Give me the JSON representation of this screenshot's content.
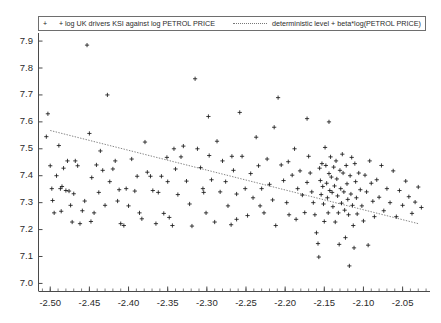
{
  "chart_data": {
    "type": "scatter",
    "title": "",
    "subtitle": "",
    "xlabel": "",
    "ylabel": "",
    "xlim": [
      -2.515,
      -2.015
    ],
    "ylim": [
      6.97,
      7.93
    ],
    "grid": false,
    "legend_position": "top-left",
    "legend": [
      {
        "name": "log UK drivers KSI against log PETROL PRICE",
        "marker": "plus",
        "style": "markers",
        "symbol": "+  +"
      },
      {
        "name": "deterministic level + beta*log(PETROL PRICE)",
        "marker": "none",
        "style": "dotted-line",
        "symbol": "......."
      }
    ],
    "xticks": [
      "-2.50",
      "-2.45",
      "-2.40",
      "-2.35",
      "-2.30",
      "-2.25",
      "-2.20",
      "-2.15",
      "-2.10",
      "-2.05"
    ],
    "xtick_values": [
      -2.5,
      -2.45,
      -2.4,
      -2.35,
      -2.3,
      -2.25,
      -2.2,
      -2.15,
      -2.1,
      -2.05
    ],
    "yticks": [
      "7.9",
      "7.8",
      "7.7",
      "7.6",
      "7.5",
      "7.4",
      "7.3",
      "7.2",
      "7.1",
      "7.0"
    ],
    "ytick_values": [
      7.9,
      7.8,
      7.7,
      7.6,
      7.5,
      7.4,
      7.3,
      7.2,
      7.1,
      7.0
    ],
    "series": [
      {
        "name": "log UK drivers KSI against log PETROL PRICE",
        "type": "scatter",
        "marker": "plus",
        "color": "#1a1a1a",
        "points": [
          [
            -2.503,
            7.63
          ],
          [
            -2.505,
            7.545
          ],
          [
            -2.5,
            7.437
          ],
          [
            -2.498,
            7.352
          ],
          [
            -2.497,
            7.308
          ],
          [
            -2.495,
            7.262
          ],
          [
            -2.492,
            7.4
          ],
          [
            -2.489,
            7.512
          ],
          [
            -2.487,
            7.352
          ],
          [
            -2.485,
            7.36
          ],
          [
            -2.483,
            7.428
          ],
          [
            -2.48,
            7.345
          ],
          [
            -2.478,
            7.455
          ],
          [
            -2.476,
            7.343
          ],
          [
            -2.474,
            7.29
          ],
          [
            -2.47,
            7.333
          ],
          [
            -2.468,
            7.455
          ],
          [
            -2.465,
            7.437
          ],
          [
            -2.462,
            7.222
          ],
          [
            -2.459,
            7.27
          ],
          [
            -2.456,
            7.306
          ],
          [
            -2.453,
            7.885
          ],
          [
            -2.45,
            7.557
          ],
          [
            -2.447,
            7.393
          ],
          [
            -2.444,
            7.262
          ],
          [
            -2.441,
            7.44
          ],
          [
            -2.438,
            7.338
          ],
          [
            -2.436,
            7.492
          ],
          [
            -2.433,
            7.42
          ],
          [
            -2.43,
            7.29
          ],
          [
            -2.427,
            7.7
          ],
          [
            -2.424,
            7.378
          ],
          [
            -2.42,
            7.425
          ],
          [
            -2.417,
            7.455
          ],
          [
            -2.414,
            7.306
          ],
          [
            -2.41,
            7.222
          ],
          [
            -2.406,
            7.215
          ],
          [
            -2.403,
            7.352
          ],
          [
            -2.4,
            7.288
          ],
          [
            -2.396,
            7.462
          ],
          [
            -2.392,
            7.343
          ],
          [
            -2.389,
            7.398
          ],
          [
            -2.386,
            7.262
          ],
          [
            -2.383,
            7.24
          ],
          [
            -2.379,
            7.525
          ],
          [
            -2.376,
            7.413
          ],
          [
            -2.372,
            7.398
          ],
          [
            -2.369,
            7.345
          ],
          [
            -2.365,
            7.222
          ],
          [
            -2.362,
            7.338
          ],
          [
            -2.358,
            7.398
          ],
          [
            -2.355,
            7.26
          ],
          [
            -2.351,
            7.468
          ],
          [
            -2.348,
            7.245
          ],
          [
            -2.344,
            7.215
          ],
          [
            -2.34,
            7.425
          ],
          [
            -2.337,
            7.33
          ],
          [
            -2.333,
            7.47
          ],
          [
            -2.33,
            7.51
          ],
          [
            -2.326,
            7.38
          ],
          [
            -2.322,
            7.295
          ],
          [
            -2.319,
            7.213
          ],
          [
            -2.315,
            7.76
          ],
          [
            -2.312,
            7.5
          ],
          [
            -2.308,
            7.43
          ],
          [
            -2.305,
            7.352
          ],
          [
            -2.301,
            7.262
          ],
          [
            -2.297,
            7.475
          ],
          [
            -2.294,
            7.385
          ],
          [
            -2.29,
            7.228
          ],
          [
            -2.287,
            7.528
          ],
          [
            -2.283,
            7.34
          ],
          [
            -2.28,
            7.455
          ],
          [
            -2.276,
            7.378
          ],
          [
            -2.273,
            7.288
          ],
          [
            -2.269,
            7.218
          ],
          [
            -2.266,
            7.42
          ],
          [
            -2.262,
            7.332
          ],
          [
            -2.258,
            7.635
          ],
          [
            -2.255,
            7.472
          ],
          [
            -2.251,
            7.352
          ],
          [
            -2.248,
            7.252
          ],
          [
            -2.244,
            7.408
          ],
          [
            -2.241,
            7.318
          ],
          [
            -2.237,
            7.543
          ],
          [
            -2.234,
            7.437
          ],
          [
            -2.23,
            7.352
          ],
          [
            -2.227,
            7.262
          ],
          [
            -2.223,
            7.462
          ],
          [
            -2.22,
            7.368
          ],
          [
            -2.216,
            7.31
          ],
          [
            -2.212,
            7.215
          ],
          [
            -2.209,
            7.69
          ],
          [
            -2.205,
            7.44
          ],
          [
            -2.202,
            7.382
          ],
          [
            -2.198,
            7.3
          ],
          [
            -2.195,
            7.255
          ],
          [
            -2.191,
            7.402
          ],
          [
            -2.188,
            7.5
          ],
          [
            -2.184,
            7.352
          ],
          [
            -2.181,
            7.418
          ],
          [
            -2.178,
            7.328
          ],
          [
            -2.175,
            7.263
          ],
          [
            -2.172,
            7.375
          ],
          [
            -2.17,
            7.472
          ],
          [
            -2.168,
            7.41
          ],
          [
            -2.166,
            7.34
          ],
          [
            -2.164,
            7.3
          ],
          [
            -2.162,
            7.255
          ],
          [
            -2.16,
            7.188
          ],
          [
            -2.158,
            7.148
          ],
          [
            -2.157,
            7.098
          ],
          [
            -2.156,
            7.428
          ],
          [
            -2.155,
            7.382
          ],
          [
            -2.154,
            7.33
          ],
          [
            -2.153,
            7.445
          ],
          [
            -2.152,
            7.36
          ],
          [
            -2.151,
            7.295
          ],
          [
            -2.15,
            7.23
          ],
          [
            -2.149,
            7.505
          ],
          [
            -2.148,
            7.438
          ],
          [
            -2.147,
            7.372
          ],
          [
            -2.146,
            7.318
          ],
          [
            -2.145,
            7.262
          ],
          [
            -2.144,
            7.408
          ],
          [
            -2.143,
            7.345
          ],
          [
            -2.142,
            7.47
          ],
          [
            -2.141,
            7.395
          ],
          [
            -2.14,
            7.338
          ],
          [
            -2.139,
            7.285
          ],
          [
            -2.138,
            7.432
          ],
          [
            -2.137,
            7.362
          ],
          [
            -2.136,
            7.228
          ],
          [
            -2.135,
            7.455
          ],
          [
            -2.134,
            7.388
          ],
          [
            -2.133,
            7.325
          ],
          [
            -2.132,
            7.262
          ],
          [
            -2.131,
            7.145
          ],
          [
            -2.13,
            7.42
          ],
          [
            -2.129,
            7.352
          ],
          [
            -2.128,
            7.298
          ],
          [
            -2.127,
            7.48
          ],
          [
            -2.126,
            7.41
          ],
          [
            -2.125,
            7.34
          ],
          [
            -2.124,
            7.272
          ],
          [
            -2.123,
            7.17
          ],
          [
            -2.122,
            7.438
          ],
          [
            -2.121,
            7.37
          ],
          [
            -2.12,
            7.312
          ],
          [
            -2.119,
            7.255
          ],
          [
            -2.118,
            7.065
          ],
          [
            -2.117,
            7.4
          ],
          [
            -2.116,
            7.332
          ],
          [
            -2.115,
            7.468
          ],
          [
            -2.114,
            7.29
          ],
          [
            -2.113,
            7.215
          ],
          [
            -2.112,
            7.132
          ],
          [
            -2.111,
            7.445
          ],
          [
            -2.11,
            7.378
          ],
          [
            -2.109,
            7.318
          ],
          [
            -2.108,
            7.258
          ],
          [
            -2.106,
            7.41
          ],
          [
            -2.104,
            7.348
          ],
          [
            -2.102,
            7.288
          ],
          [
            -2.1,
            7.232
          ],
          [
            -2.098,
            7.402
          ],
          [
            -2.096,
            7.34
          ],
          [
            -2.094,
            7.142
          ],
          [
            -2.092,
            7.455
          ],
          [
            -2.09,
            7.372
          ],
          [
            -2.088,
            7.305
          ],
          [
            -2.086,
            7.248
          ],
          [
            -2.083,
            7.385
          ],
          [
            -2.08,
            7.32
          ],
          [
            -2.077,
            7.438
          ],
          [
            -2.074,
            7.27
          ],
          [
            -2.07,
            7.352
          ],
          [
            -2.066,
            7.3
          ],
          [
            -2.062,
            7.418
          ],
          [
            -2.058,
            7.248
          ],
          [
            -2.054,
            7.345
          ],
          [
            -2.05,
            7.29
          ],
          [
            -2.046,
            7.38
          ],
          [
            -2.042,
            7.322
          ],
          [
            -2.038,
            7.26
          ],
          [
            -2.034,
            7.302
          ],
          [
            -2.03,
            7.358
          ],
          [
            -2.026,
            7.282
          ],
          [
            -2.35,
            7.378
          ],
          [
            -2.342,
            7.5
          ],
          [
            -2.298,
            7.62
          ],
          [
            -2.262,
            7.238
          ],
          [
            -2.214,
            7.58
          ],
          [
            -2.186,
            7.238
          ],
          [
            -2.172,
            7.612
          ],
          [
            -2.144,
            7.6
          ],
          [
            -2.196,
            7.452
          ],
          [
            -2.232,
            7.288
          ],
          [
            -2.268,
            7.472
          ],
          [
            -2.304,
            7.338
          ],
          [
            -2.486,
            7.268
          ],
          [
            -2.472,
            7.228
          ],
          [
            -2.448,
            7.23
          ],
          [
            -2.412,
            7.348
          ]
        ]
      },
      {
        "name": "deterministic level + beta*log(PETROL PRICE)",
        "type": "line",
        "style": "dotted",
        "color": "#777777",
        "line": [
          [
            -2.5,
            7.568
          ],
          [
            -2.03,
            7.222
          ]
        ]
      }
    ]
  },
  "legend": {
    "entry1_symbol": "+  +",
    "entry1_label": "log UK drivers KSI against log PETROL PRICE",
    "entry2_label": "deterministic level + beta*log(PETROL PRICE)"
  },
  "axes": {
    "y_labels": [
      "7.9",
      "7.8",
      "7.7",
      "7.6",
      "7.5",
      "7.4",
      "7.3",
      "7.2",
      "7.1",
      "7.0"
    ],
    "x_labels": [
      "-2.50",
      "-2.45",
      "-2.40",
      "-2.35",
      "-2.30",
      "-2.25",
      "-2.20",
      "-2.15",
      "-2.10",
      "-2.05"
    ]
  },
  "colors": {
    "marker": "#1a1a1a",
    "trendline": "#777777",
    "axis": "#4a4a4a",
    "background": "#ffffff"
  }
}
